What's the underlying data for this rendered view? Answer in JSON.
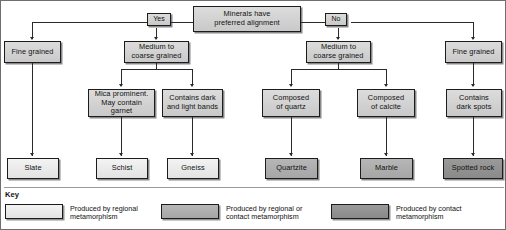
{
  "diagram": {
    "root": {
      "label": "Minerals have\npreferred alignment"
    },
    "branch_labels": {
      "yes": "Yes",
      "no": "No"
    },
    "level2": [
      {
        "id": "fine-grained-left",
        "label": "Fine grained"
      },
      {
        "id": "medium-coarse-left",
        "label": "Medium to\ncoarse grained"
      },
      {
        "id": "medium-coarse-right",
        "label": "Medium to\ncoarse grained"
      },
      {
        "id": "fine-grained-right",
        "label": "Fine grained"
      }
    ],
    "level3": [
      {
        "id": "mica-prominent",
        "label": "Mica prominent.\nMay contain garnet"
      },
      {
        "id": "dark-light-bands",
        "label": "Contains dark\nand light bands"
      },
      {
        "id": "composed-quartz",
        "label": "Composed\nof quartz"
      },
      {
        "id": "composed-calcite",
        "label": "Composed\nof calcite"
      },
      {
        "id": "dark-spots",
        "label": "Contains\ndark spots"
      }
    ],
    "results": [
      {
        "id": "slate",
        "label": "Slate",
        "shade": "light"
      },
      {
        "id": "schist",
        "label": "Schist",
        "shade": "light"
      },
      {
        "id": "gneiss",
        "label": "Gneiss",
        "shade": "light"
      },
      {
        "id": "quartzite",
        "label": "Quartzite",
        "shade": "medgray"
      },
      {
        "id": "marble",
        "label": "Marble",
        "shade": "medgray"
      },
      {
        "id": "spotted-rock",
        "label": "Spotted rock",
        "shade": "dark"
      }
    ]
  },
  "key": {
    "title": "Key",
    "entries": [
      {
        "id": "regional",
        "swatch": "light",
        "text": "Produced by regional\nmetamorphism"
      },
      {
        "id": "regional-contact",
        "swatch": "medgray",
        "text": "Produced by regional or\ncontact metamorphism"
      },
      {
        "id": "contact",
        "swatch": "dark",
        "text": "Produced by contact\nmetamorphism"
      }
    ]
  },
  "colors": {
    "light": "#ededed",
    "mid": "#d2d2d2",
    "medgray": "#aeaeae",
    "dark": "#919191",
    "line": "#2a2a2a",
    "border": "#1c1c1c"
  }
}
